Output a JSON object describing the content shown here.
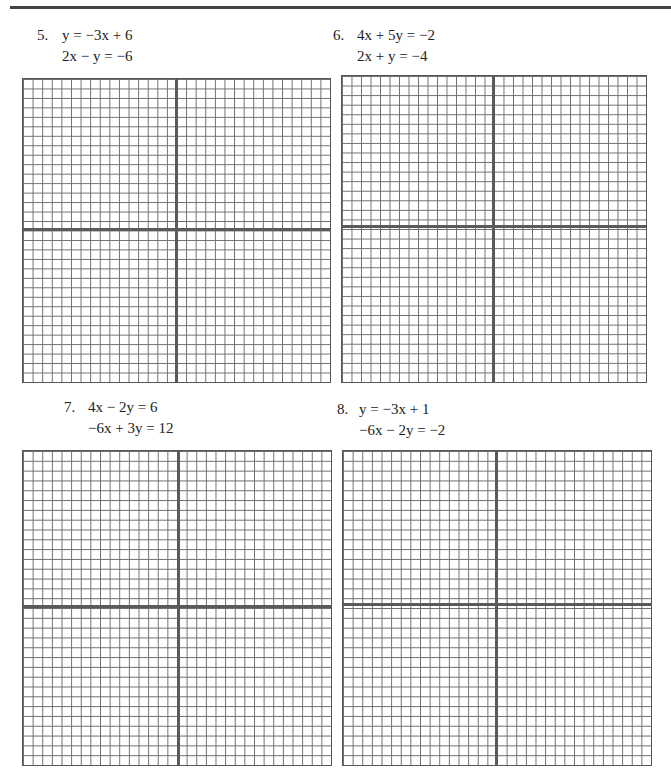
{
  "page": {
    "problems": [
      {
        "number": "5.",
        "equations": [
          "y = −3x + 6",
          "2x − y = −6"
        ],
        "grid": {
          "columns": 32,
          "rows": 32
        }
      },
      {
        "number": "6.",
        "equations": [
          "4x + 5y = −2",
          "2x + y = −4"
        ],
        "grid": {
          "columns": 32,
          "rows": 32
        }
      },
      {
        "number": "7.",
        "equations": [
          "4x − 2y = 6",
          "−6x + 3y = 12"
        ],
        "grid": {
          "columns": 32,
          "rows": 32
        }
      },
      {
        "number": "8.",
        "equations": [
          "y = −3x + 1",
          "−6x − 2y = −2"
        ],
        "grid": {
          "columns": 32,
          "rows": 32
        }
      }
    ]
  },
  "colors": {
    "grid_line": "#555555",
    "axis_line": "#5a5a5a",
    "rule": "#444444"
  }
}
